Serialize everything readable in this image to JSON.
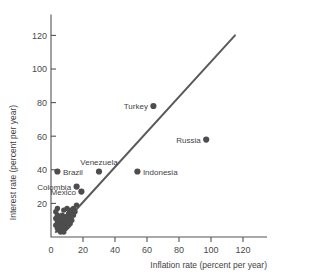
{
  "chart_data": {
    "type": "scatter",
    "title": "",
    "xlabel": "Inflation rate (percent per year)",
    "ylabel": "Interest rate (percent per year)",
    "xlim": [
      0,
      140
    ],
    "ylim": [
      0,
      130
    ],
    "xticks": [
      0,
      20,
      40,
      60,
      80,
      100,
      120
    ],
    "yticks": [
      20,
      40,
      60,
      80,
      100,
      120
    ],
    "grid": false,
    "legend": "none",
    "reference_line": {
      "name": "45-degree line",
      "x": [
        3,
        115
      ],
      "y": [
        3,
        120
      ]
    },
    "labeled_points": [
      {
        "label": "Turkey",
        "x": 64,
        "y": 78,
        "label_side": "left"
      },
      {
        "label": "Russia",
        "x": 97,
        "y": 58,
        "label_side": "left"
      },
      {
        "label": "Venezuela",
        "x": 30,
        "y": 39,
        "label_side": "above"
      },
      {
        "label": "Brazil",
        "x": 4,
        "y": 39,
        "label_side": "right"
      },
      {
        "label": "Colombia",
        "x": 16,
        "y": 30,
        "label_side": "left"
      },
      {
        "label": "Mexico",
        "x": 19,
        "y": 27,
        "label_side": "left"
      },
      {
        "label": "Indonesia",
        "x": 54,
        "y": 39,
        "label_side": "right"
      }
    ],
    "unlabeled_points": [
      {
        "x": 3,
        "y": 15
      },
      {
        "x": 4,
        "y": 13
      },
      {
        "x": 3,
        "y": 11
      },
      {
        "x": 4,
        "y": 9
      },
      {
        "x": 3,
        "y": 7
      },
      {
        "x": 4,
        "y": 5
      },
      {
        "x": 5,
        "y": 4
      },
      {
        "x": 6,
        "y": 5
      },
      {
        "x": 5,
        "y": 8
      },
      {
        "x": 6,
        "y": 10
      },
      {
        "x": 7,
        "y": 13
      },
      {
        "x": 6,
        "y": 7
      },
      {
        "x": 7,
        "y": 8
      },
      {
        "x": 8,
        "y": 6
      },
      {
        "x": 8,
        "y": 10
      },
      {
        "x": 9,
        "y": 12
      },
      {
        "x": 9,
        "y": 8
      },
      {
        "x": 10,
        "y": 6
      },
      {
        "x": 10,
        "y": 9
      },
      {
        "x": 11,
        "y": 11
      },
      {
        "x": 11,
        "y": 14
      },
      {
        "x": 12,
        "y": 16
      },
      {
        "x": 10,
        "y": 17
      },
      {
        "x": 8,
        "y": 16
      },
      {
        "x": 12,
        "y": 12
      },
      {
        "x": 13,
        "y": 10
      },
      {
        "x": 13,
        "y": 14
      },
      {
        "x": 14,
        "y": 17
      },
      {
        "x": 15,
        "y": 15
      },
      {
        "x": 12,
        "y": 8
      },
      {
        "x": 9,
        "y": 5
      },
      {
        "x": 7,
        "y": 4
      },
      {
        "x": 6,
        "y": 3
      },
      {
        "x": 8,
        "y": 3
      },
      {
        "x": 5,
        "y": 11
      },
      {
        "x": 4,
        "y": 17
      },
      {
        "x": 16,
        "y": 19
      },
      {
        "x": 14,
        "y": 13
      },
      {
        "x": 11,
        "y": 7
      },
      {
        "x": 5,
        "y": 6
      }
    ]
  }
}
